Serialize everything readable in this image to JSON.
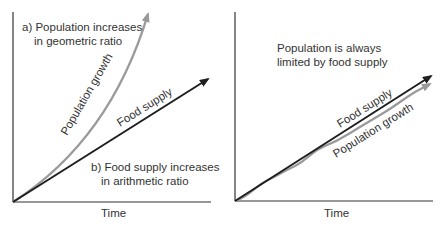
{
  "colors": {
    "axis": "#333333",
    "food_supply": "#1e1e1e",
    "population": "#9a9a9a",
    "text": "#333333"
  },
  "panel_left": {
    "caption_a_line1": "a) Population increases",
    "caption_a_line2": "in geometric ratio",
    "caption_b_line1": "b) Food supply increases",
    "caption_b_line2": "in arithmetic ratio",
    "population_label": "Population growth",
    "food_label": "Food supply",
    "xlabel": "Time"
  },
  "panel_right": {
    "caption_line1": "Population is always",
    "caption_line2": "limited by food supply",
    "food_label": "Food supply",
    "population_label": "Population growth",
    "xlabel": "Time"
  }
}
